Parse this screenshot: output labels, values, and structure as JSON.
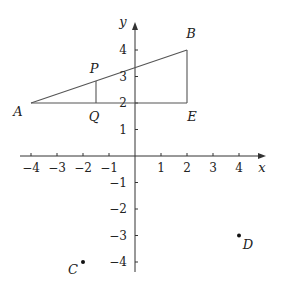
{
  "diagram": {
    "type": "coordinate-plane",
    "axes": {
      "x_label": "x",
      "y_label": "y",
      "x_range": [
        -4,
        4
      ],
      "y_range": [
        -4,
        4
      ],
      "x_ticks": [
        {
          "value": -4,
          "label": "−4"
        },
        {
          "value": -3,
          "label": "−3"
        },
        {
          "value": -2,
          "label": "−2"
        },
        {
          "value": -1,
          "label": "−1"
        },
        {
          "value": 1,
          "label": "1"
        },
        {
          "value": 2,
          "label": "2"
        },
        {
          "value": 3,
          "label": "3"
        },
        {
          "value": 4,
          "label": "4"
        }
      ],
      "y_ticks": [
        {
          "value": 4,
          "label": "4"
        },
        {
          "value": 3,
          "label": "3"
        },
        {
          "value": 2,
          "label": "2"
        },
        {
          "value": 1,
          "label": "1"
        },
        {
          "value": -1,
          "label": "−1"
        },
        {
          "value": -2,
          "label": "−2"
        },
        {
          "value": -3,
          "label": "−3"
        },
        {
          "value": -4,
          "label": "−4"
        }
      ]
    },
    "points": {
      "A": {
        "label": "A",
        "x": -4,
        "y": 2
      },
      "B": {
        "label": "B",
        "x": 2,
        "y": 4
      },
      "E": {
        "label": "E",
        "x": 2,
        "y": 2
      },
      "P": {
        "label": "P",
        "x": -1.5,
        "y": 2.83
      },
      "Q": {
        "label": "Q",
        "x": -1.5,
        "y": 2
      },
      "C": {
        "label": "C",
        "x": -2,
        "y": -4
      },
      "D": {
        "label": "D",
        "x": 4,
        "y": -3
      }
    },
    "segments": [
      {
        "from": "A",
        "to": "B"
      },
      {
        "from": "A",
        "to": "E"
      },
      {
        "from": "B",
        "to": "E"
      },
      {
        "from": "P",
        "to": "Q"
      }
    ],
    "dots": [
      "C",
      "D"
    ],
    "colors": {
      "line": "#555555",
      "axis": "#333333",
      "text": "#222222",
      "dot": "#111111"
    }
  }
}
